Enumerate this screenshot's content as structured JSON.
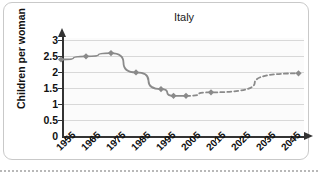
{
  "card": {
    "name": "chart-card"
  },
  "chart_data": {
    "type": "line",
    "title": "Italy",
    "xlabel": "",
    "ylabel": "Children per woman",
    "x": [
      1955,
      1965,
      1975,
      1985,
      1995,
      2000,
      2005,
      2015,
      2050
    ],
    "categories": [
      "1955",
      "1965",
      "1975",
      "1985",
      "1995",
      "2005",
      "2015",
      "2025",
      "2035",
      "2045"
    ],
    "xtick_labels": [
      "1955",
      "1965",
      "1975",
      "1985",
      "1995",
      "2005",
      "2015",
      "2025",
      "2035",
      "2045"
    ],
    "ytick_labels": [
      "0",
      "0.5",
      "1",
      "1.5",
      "2",
      "2.5",
      "3"
    ],
    "ytick_values": [
      0,
      0.5,
      1,
      1.5,
      2,
      2.5,
      3
    ],
    "ylim": [
      0,
      3
    ],
    "xlim": [
      1955,
      2050
    ],
    "grid": true,
    "legend": "none",
    "series": [
      {
        "name": "observed",
        "style": "solid",
        "color": "#8a8a8a",
        "points": [
          {
            "x": 1955,
            "y": 2.3
          },
          {
            "x": 1965,
            "y": 2.4
          },
          {
            "x": 1975,
            "y": 2.5
          },
          {
            "x": 1985,
            "y": 1.9
          },
          {
            "x": 1995,
            "y": 1.38
          },
          {
            "x": 2000,
            "y": 1.17
          },
          {
            "x": 2005,
            "y": 1.17
          }
        ]
      },
      {
        "name": "projected",
        "style": "dashed",
        "color": "#8a8a8a",
        "points": [
          {
            "x": 2005,
            "y": 1.17
          },
          {
            "x": 2015,
            "y": 1.28
          },
          {
            "x": 2050,
            "y": 1.87
          }
        ]
      }
    ],
    "marker": "diamond",
    "marker_color": "#8a8a8a"
  },
  "colors": {
    "line": "#8a8a8a",
    "axis": "#333333",
    "grid": "#d8d8d8",
    "plot_bg": "#fbfbfb",
    "card_border": "#c9c9c9",
    "text": "#111111"
  }
}
